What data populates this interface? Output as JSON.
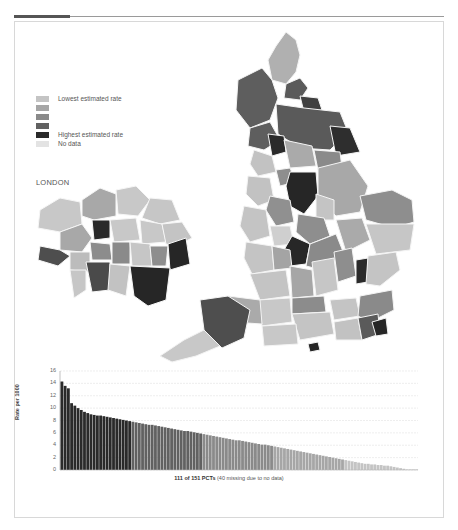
{
  "legend": {
    "items": [
      {
        "label": "Lowest estimated rate",
        "color": "#c4c4c4"
      },
      {
        "label": "",
        "color": "#a6a6a6"
      },
      {
        "label": "",
        "color": "#8a8a8a"
      },
      {
        "label": "",
        "color": "#616161"
      },
      {
        "label": "Highest estimated rate",
        "color": "#2a2a2a"
      },
      {
        "label": "No data",
        "color": "#e3e3e3"
      }
    ]
  },
  "london": {
    "title": "LONDON"
  },
  "chart_data": {
    "type": "bar",
    "title": "",
    "xlabel": "111 of 151 PCTs (40 missing due to no data)",
    "ylabel": "Rate per 1000",
    "ylim": [
      0,
      16
    ],
    "yticks": [
      0,
      2,
      4,
      6,
      8,
      10,
      12,
      14,
      16
    ],
    "grid": true,
    "legend_position": "none",
    "categories_count": 111,
    "values": [
      14.3,
      13.6,
      13.2,
      10.8,
      10.4,
      10.0,
      9.7,
      9.4,
      9.2,
      9.0,
      8.9,
      8.8,
      8.8,
      8.7,
      8.6,
      8.5,
      8.4,
      8.3,
      8.2,
      8.1,
      8.0,
      7.9,
      7.8,
      7.7,
      7.6,
      7.5,
      7.4,
      7.3,
      7.3,
      7.2,
      7.1,
      7.0,
      6.9,
      6.8,
      6.7,
      6.6,
      6.5,
      6.4,
      6.3,
      6.3,
      6.2,
      6.1,
      6.0,
      5.9,
      5.8,
      5.7,
      5.6,
      5.5,
      5.4,
      5.3,
      5.2,
      5.1,
      5.0,
      4.9,
      4.8,
      4.8,
      4.7,
      4.6,
      4.5,
      4.4,
      4.3,
      4.2,
      4.1,
      4.1,
      4.0,
      3.9,
      3.8,
      3.7,
      3.6,
      3.5,
      3.4,
      3.3,
      3.2,
      3.1,
      3.0,
      2.9,
      2.8,
      2.7,
      2.6,
      2.5,
      2.4,
      2.3,
      2.2,
      2.1,
      2.0,
      1.9,
      1.8,
      1.7,
      1.6,
      1.5,
      1.4,
      1.3,
      1.2,
      1.1,
      1.0,
      1.0,
      0.9,
      0.9,
      0.8,
      0.8,
      0.7,
      0.7,
      0.6,
      0.5,
      0.4,
      0.3,
      0.2,
      0.1,
      0.1,
      0.1,
      0.1
    ],
    "bands": [
      {
        "from": 0,
        "to": 22,
        "color": "#2a2a2a"
      },
      {
        "from": 22,
        "to": 44,
        "color": "#616161"
      },
      {
        "from": 44,
        "to": 66,
        "color": "#8a8a8a"
      },
      {
        "from": 66,
        "to": 88,
        "color": "#a6a6a6"
      },
      {
        "from": 88,
        "to": 111,
        "color": "#c4c4c4"
      }
    ]
  },
  "caption": {
    "bold": "111 of 151 PCTs",
    "rest": " (40 missing due to no data)"
  }
}
